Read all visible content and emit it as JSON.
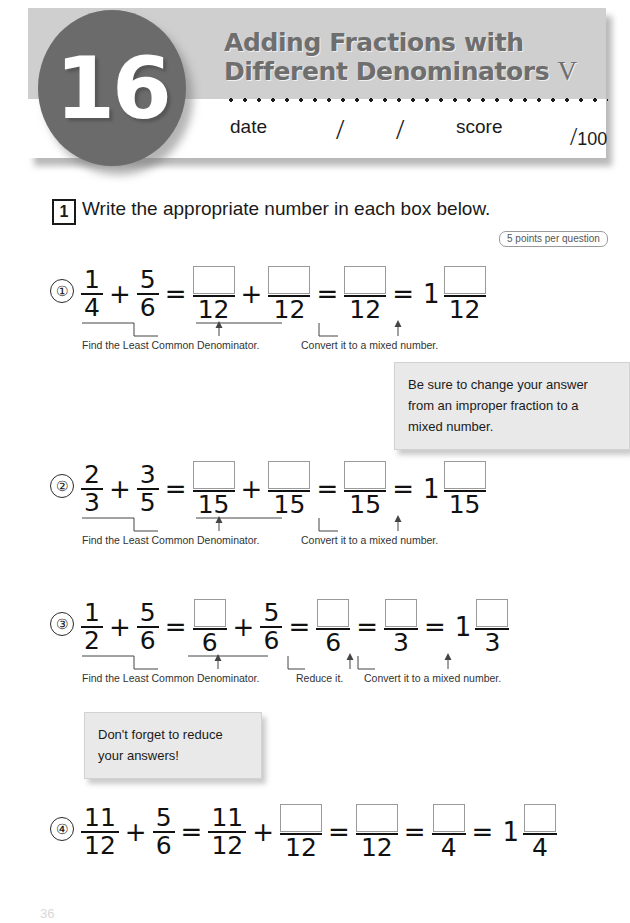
{
  "header": {
    "lesson_number": "16",
    "title_line1": "Adding Fractions with",
    "title_line2": "Different Denominators",
    "title_numeral": "V",
    "date_label": "date",
    "score_label": "score",
    "slash_1": "/",
    "slash_2": "/",
    "score_total": "100",
    "score_slash": "/",
    "circle_color": "#6b6b6b",
    "band_color": "#cfcfcf",
    "title_color": "#6e6e6e"
  },
  "instruction": {
    "number": "1",
    "text": "Write the appropriate number in each box below.",
    "points_badge": "5 points per question"
  },
  "annotations": {
    "lcd": "Find the Least Common Denominator.",
    "mixed": "Convert it to a mixed number.",
    "reduce": "Reduce it."
  },
  "callouts": [
    {
      "id": "improper-fraction-note",
      "lines": [
        "Be sure to change your answer",
        "from an improper fraction to a",
        "mixed number."
      ]
    },
    {
      "id": "reduce-note",
      "lines": [
        "Don't forget to reduce",
        "your answers!"
      ]
    }
  ],
  "problems": [
    {
      "number": "①",
      "terms": [
        {
          "kind": "frac",
          "num": "1",
          "den": "4"
        },
        {
          "kind": "op",
          "text": "+"
        },
        {
          "kind": "frac",
          "num": "5",
          "den": "6"
        },
        {
          "kind": "op",
          "text": "="
        },
        {
          "kind": "frac",
          "num": "",
          "den": "12",
          "box": true
        },
        {
          "kind": "op",
          "text": "+"
        },
        {
          "kind": "frac",
          "num": "",
          "den": "12",
          "box": true
        },
        {
          "kind": "op",
          "text": "="
        },
        {
          "kind": "frac",
          "num": "",
          "den": "12",
          "box": true
        },
        {
          "kind": "op",
          "text": "="
        },
        {
          "kind": "whole",
          "text": "1"
        },
        {
          "kind": "frac",
          "num": "",
          "den": "12",
          "box": true
        }
      ]
    },
    {
      "number": "②",
      "terms": [
        {
          "kind": "frac",
          "num": "2",
          "den": "3"
        },
        {
          "kind": "op",
          "text": "+"
        },
        {
          "kind": "frac",
          "num": "3",
          "den": "5"
        },
        {
          "kind": "op",
          "text": "="
        },
        {
          "kind": "frac",
          "num": "",
          "den": "15",
          "box": true
        },
        {
          "kind": "op",
          "text": "+"
        },
        {
          "kind": "frac",
          "num": "",
          "den": "15",
          "box": true
        },
        {
          "kind": "op",
          "text": "="
        },
        {
          "kind": "frac",
          "num": "",
          "den": "15",
          "box": true
        },
        {
          "kind": "op",
          "text": "="
        },
        {
          "kind": "whole",
          "text": "1"
        },
        {
          "kind": "frac",
          "num": "",
          "den": "15",
          "box": true
        }
      ]
    },
    {
      "number": "③",
      "terms": [
        {
          "kind": "frac",
          "num": "1",
          "den": "2"
        },
        {
          "kind": "op",
          "text": "+"
        },
        {
          "kind": "frac",
          "num": "5",
          "den": "6"
        },
        {
          "kind": "op",
          "text": "="
        },
        {
          "kind": "frac",
          "num": "",
          "den": "6",
          "box": true
        },
        {
          "kind": "op",
          "text": "+"
        },
        {
          "kind": "frac",
          "num": "5",
          "den": "6"
        },
        {
          "kind": "op",
          "text": "="
        },
        {
          "kind": "frac",
          "num": "",
          "den": "6",
          "box": true
        },
        {
          "kind": "op",
          "text": "="
        },
        {
          "kind": "frac",
          "num": "",
          "den": "3",
          "box": true
        },
        {
          "kind": "op",
          "text": "="
        },
        {
          "kind": "whole",
          "text": "1"
        },
        {
          "kind": "frac",
          "num": "",
          "den": "3",
          "box": true
        }
      ]
    },
    {
      "number": "④",
      "terms": [
        {
          "kind": "frac",
          "num": "11",
          "den": "12"
        },
        {
          "kind": "op",
          "text": "+"
        },
        {
          "kind": "frac",
          "num": "5",
          "den": "6"
        },
        {
          "kind": "op",
          "text": "="
        },
        {
          "kind": "frac",
          "num": "11",
          "den": "12"
        },
        {
          "kind": "op",
          "text": "+"
        },
        {
          "kind": "frac",
          "num": "",
          "den": "12",
          "box": true
        },
        {
          "kind": "op",
          "text": "="
        },
        {
          "kind": "frac",
          "num": "",
          "den": "12",
          "box": true
        },
        {
          "kind": "op",
          "text": "="
        },
        {
          "kind": "frac",
          "num": "",
          "den": "4",
          "box": true
        },
        {
          "kind": "op",
          "text": "="
        },
        {
          "kind": "whole",
          "text": "1"
        },
        {
          "kind": "frac",
          "num": "",
          "den": "4",
          "box": true
        }
      ]
    }
  ],
  "page_number": "36"
}
